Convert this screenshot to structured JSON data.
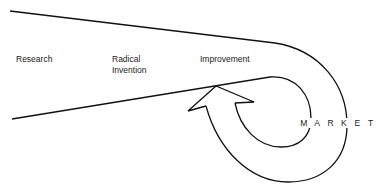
{
  "diagram": {
    "labels": {
      "research": "Research",
      "radical_line1": "Radical",
      "radical_line2": "Invention",
      "improvement": "Improvement",
      "market_letters": [
        "M",
        "A",
        "R",
        "K",
        "E",
        "T"
      ],
      "market": "MARKET"
    },
    "colors": {
      "stroke": "#111111",
      "text": "#1a1a1a",
      "background": "#ffffff"
    }
  }
}
